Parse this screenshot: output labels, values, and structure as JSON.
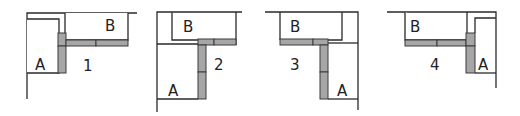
{
  "colors": {
    "line": "#2a2a2a",
    "bar_fill": "#a6a6a6",
    "background": "#ffffff"
  },
  "diagrams": [
    {
      "number": "1",
      "label_a": "A",
      "label_b": "B",
      "description": "Cabinet A on left, cabinet B on top wall; corner filler at A's top-right, horizontal filler along B's bottom"
    },
    {
      "number": "2",
      "label_a": "A",
      "label_b": "B",
      "description": "Cabinet B top, cabinet A bottom-left; vertical filler between A and open side, horizontal filler under B"
    },
    {
      "number": "3",
      "label_a": "A",
      "label_b": "B",
      "description": "Mirror of 2: cabinet B top-left, cabinet A bottom-right; vertical filler on A's left, horizontal filler under B"
    },
    {
      "number": "4",
      "label_a": "A",
      "label_b": "B",
      "description": "Mirror of 1: cabinet A on right, cabinet B on top wall; corner filler at A's top-left, horizontal filler under B"
    }
  ]
}
